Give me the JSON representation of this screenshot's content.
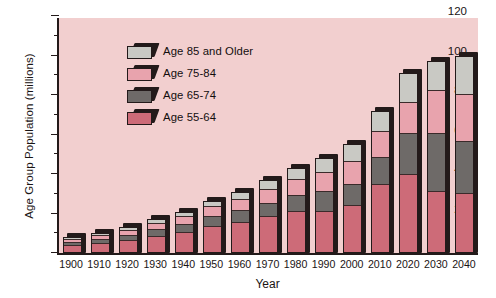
{
  "chart_data": {
    "type": "bar",
    "stacked": true,
    "title": "",
    "subtitle": "",
    "xlabel": "Year",
    "ylabel": "Age Group Population (millions)",
    "ylim": [
      0,
      120
    ],
    "ytick_step": 20,
    "yminor_step": 10,
    "grid": false,
    "legend_position": "upper-left inside plot",
    "plot_background": "#f2cfcf",
    "categories": [
      "1900",
      "1910",
      "1920",
      "1930",
      "1940",
      "1950",
      "1960",
      "1970",
      "1980",
      "1990",
      "2000",
      "2010",
      "2020",
      "2030",
      "2040"
    ],
    "ytick_labels": [
      "0",
      "20",
      "40",
      "60",
      "80",
      "100",
      "120"
    ],
    "series": [
      {
        "name": "Age 55-64",
        "color": "#cd6b78",
        "values": [
          4.0,
          5.0,
          6.5,
          8.5,
          10.5,
          13.5,
          15.5,
          18.5,
          21.5,
          21.0,
          24.0,
          35.0,
          40.0,
          31.0,
          30.0
        ]
      },
      {
        "name": "Age 65-74",
        "color": "#6e6a68",
        "values": [
          2.0,
          2.5,
          3.0,
          4.0,
          4.5,
          5.5,
          6.5,
          7.0,
          8.0,
          10.5,
          11.0,
          14.0,
          21.0,
          30.0,
          27.0
        ]
      },
      {
        "name": "Age 75-84",
        "color": "#e8a3ad",
        "values": [
          1.5,
          2.0,
          2.5,
          3.0,
          4.0,
          5.0,
          6.0,
          7.5,
          8.5,
          10.0,
          12.0,
          13.0,
          16.0,
          22.0,
          24.0
        ]
      },
      {
        "name": "Age 85 and Older",
        "color": "#c9c9c4",
        "values": [
          0.5,
          0.5,
          1.0,
          1.5,
          2.0,
          2.5,
          3.0,
          4.0,
          5.0,
          6.5,
          8.0,
          10.0,
          14.0,
          14.0,
          19.0
        ]
      }
    ],
    "totals": [
      8.0,
      10.0,
      13.0,
      17.0,
      21.0,
      26.5,
      31.0,
      37.0,
      43.0,
      48.0,
      55.0,
      72.0,
      91.0,
      97.0,
      100.0
    ]
  },
  "legend": {
    "entries": [
      {
        "label": "Age 85 and Older",
        "color": "#c9c9c4"
      },
      {
        "label": "Age 75-84",
        "color": "#e8a3ad"
      },
      {
        "label": "Age 65-74",
        "color": "#6e6a68"
      },
      {
        "label": "Age 55-64",
        "color": "#cd6b78"
      }
    ]
  },
  "colors": {
    "plot_background": "#f2cfcf",
    "axis": "#231a1a",
    "page_background": "#ffffff",
    "text": "#1a1414"
  }
}
